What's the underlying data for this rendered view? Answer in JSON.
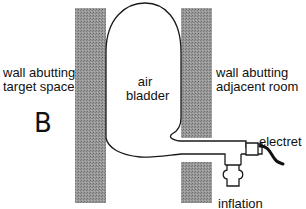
{
  "diagram": {
    "panel_label": "B",
    "labels": {
      "left_wall": [
        "wall abutting",
        "target space"
      ],
      "bladder": [
        "air",
        "bladder"
      ],
      "right_wall": [
        "wall abutting",
        "adjacent room"
      ],
      "electret": "electret",
      "inflation": "inflation"
    },
    "colors": {
      "wall_fill": "#8a8a8a",
      "stroke": "#1a1a1a",
      "background": "#ffffff"
    },
    "components": [
      {
        "id": "left-wall",
        "type": "wall"
      },
      {
        "id": "right-wall-upper",
        "type": "wall"
      },
      {
        "id": "right-wall-lower",
        "type": "wall"
      },
      {
        "id": "air-bladder",
        "type": "bladder"
      },
      {
        "id": "tube",
        "type": "tube"
      },
      {
        "id": "electret-microphone",
        "type": "sensor"
      },
      {
        "id": "inflation-valve",
        "type": "valve"
      }
    ]
  }
}
